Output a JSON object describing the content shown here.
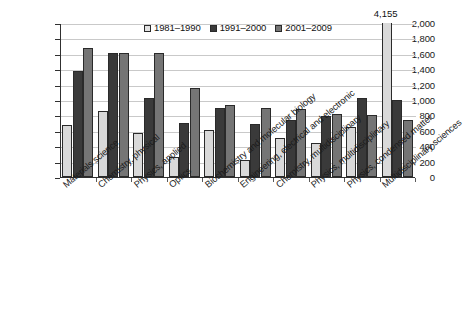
{
  "chart_data": {
    "type": "bar",
    "title": "",
    "subtitle": "",
    "xlabel": "",
    "ylabel": "",
    "ylim": [
      0,
      2000
    ],
    "ytick_labels": [
      "2,000",
      "1,800",
      "1,600",
      "1,400",
      "1,200",
      "1,000",
      "800",
      "600",
      "400",
      "200",
      "0"
    ],
    "ytick_values": [
      2000,
      1800,
      1600,
      1400,
      1200,
      1000,
      800,
      600,
      400,
      200,
      0
    ],
    "grid": true,
    "legend_position": "top-center",
    "categories": [
      "Materials science",
      "Chemistry, physical",
      "Physics, applied",
      "Optics",
      "Biochemistry and molecular biology",
      "Engineering, electrical and electronic",
      "Chemistry, multidisciplinary",
      "Physics, multidisciplinary",
      "Physics, condensed matter",
      "Multidisciplinary sciences"
    ],
    "series": [
      {
        "name": "1981–1990",
        "color": "#d9d9d9",
        "values": [
          680,
          860,
          570,
          265,
          610,
          220,
          505,
          440,
          650,
          4155
        ]
      },
      {
        "name": "1991–2000",
        "color": "#3a3a3a",
        "values": [
          1375,
          1610,
          1030,
          705,
          895,
          690,
          735,
          790,
          1020,
          995
        ]
      },
      {
        "name": "2001–2009",
        "color": "#757575",
        "values": [
          1670,
          1615,
          1610,
          1155,
          935,
          895,
          880,
          815,
          805,
          745
        ]
      }
    ],
    "annotations": [
      {
        "text": "4,155",
        "category": "Multidisciplinary sciences",
        "series": "1981–1990",
        "value": 4155,
        "note": "bar exceeds axis maximum and is clipped at the plot top"
      }
    ]
  }
}
